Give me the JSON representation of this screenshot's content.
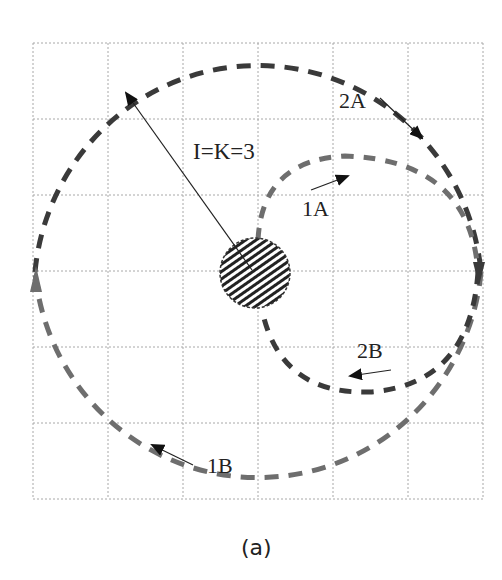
{
  "figure": {
    "caption": "(a)",
    "radius_label": "I=K=3",
    "paths": [
      {
        "id": "2A",
        "label": "2A"
      },
      {
        "id": "1A",
        "label": "1A"
      },
      {
        "id": "2B",
        "label": "2B"
      },
      {
        "id": "1B",
        "label": "1B"
      }
    ],
    "grid": {
      "columns": 6,
      "rows": 6
    },
    "colors": {
      "dark_dash": "#3a3a3a",
      "light_dash": "#6e6e6e",
      "grid": "#a0a0a0",
      "text": "#222222"
    }
  }
}
